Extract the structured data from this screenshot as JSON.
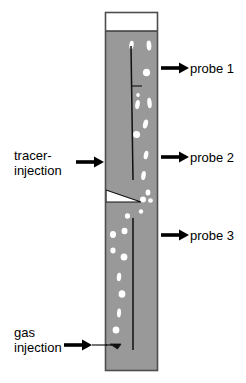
{
  "figure": {
    "type": "bubble-column-schematic",
    "background_color": "#ffffff",
    "column": {
      "body_color": "#999999",
      "border_color": "#4d4d4d",
      "freeboard_color": "#ffffff",
      "left_px": 105,
      "right_px": 158,
      "top_px": 12,
      "bottom_px": 371,
      "freeboard_bottom_px": 31
    },
    "bubble_color": "#ffffff",
    "line_color": "#000000"
  },
  "labels": {
    "probe1": "probe 1",
    "probe2": "probe 2",
    "probe3": "probe 3",
    "tracer_line1": "tracer-",
    "tracer_line2": "injection",
    "gas_line1": "gas",
    "gas_line2": "injection"
  },
  "annotations": [
    {
      "name": "probe-1",
      "text": "probe 1",
      "side": "right",
      "y": 68
    },
    {
      "name": "probe-2",
      "text": "probe 2",
      "side": "right",
      "y": 157
    },
    {
      "name": "probe-3",
      "text": "probe 3",
      "side": "right",
      "y": 235
    },
    {
      "name": "tracer-injection",
      "text": "tracer-injection",
      "side": "left",
      "y": 162
    },
    {
      "name": "gas-injection",
      "text": "gas injection",
      "side": "left",
      "y": 345
    }
  ],
  "bubbles": [
    {
      "cx": 131.5,
      "cy": 45.0,
      "rx": 2.2,
      "ry": 4.2,
      "rot": 8
    },
    {
      "cx": 149.0,
      "cy": 45.5,
      "rx": 2.4,
      "ry": 5.0,
      "rot": -4
    },
    {
      "cx": 146.5,
      "cy": 72.5,
      "rx": 3.6,
      "ry": 3.8,
      "rot": 0
    },
    {
      "cx": 138.0,
      "cy": 95.0,
      "rx": 1.8,
      "ry": 2.0,
      "rot": 0
    },
    {
      "cx": 137.5,
      "cy": 104.5,
      "rx": 2.2,
      "ry": 4.6,
      "rot": 10
    },
    {
      "cx": 149.5,
      "cy": 103.0,
      "rx": 2.2,
      "ry": 5.2,
      "rot": -6
    },
    {
      "cx": 145.5,
      "cy": 124.0,
      "rx": 2.4,
      "ry": 4.6,
      "rot": 14
    },
    {
      "cx": 136.5,
      "cy": 134.5,
      "rx": 3.6,
      "ry": 3.6,
      "rot": 0
    },
    {
      "cx": 146.0,
      "cy": 155.0,
      "rx": 2.2,
      "ry": 4.4,
      "rot": 12
    },
    {
      "cx": 143.5,
      "cy": 175.5,
      "rx": 2.2,
      "ry": 4.6,
      "rot": 10
    },
    {
      "cx": 148.0,
      "cy": 192.5,
      "rx": 2.4,
      "ry": 3.0,
      "rot": 0
    },
    {
      "cx": 143.0,
      "cy": 199.5,
      "rx": 3.0,
      "ry": 3.0,
      "rot": 0
    },
    {
      "cx": 150.5,
      "cy": 200.5,
      "rx": 2.4,
      "ry": 2.2,
      "rot": 0
    },
    {
      "cx": 141.0,
      "cy": 211.5,
      "rx": 2.2,
      "ry": 2.2,
      "rot": 0
    },
    {
      "cx": 127.5,
      "cy": 216.0,
      "rx": 2.6,
      "ry": 2.8,
      "rot": 0
    },
    {
      "cx": 124.5,
      "cy": 231.0,
      "rx": 3.0,
      "ry": 3.2,
      "rot": 0
    },
    {
      "cx": 113.0,
      "cy": 234.5,
      "rx": 3.0,
      "ry": 3.4,
      "rot": 0
    },
    {
      "cx": 113.0,
      "cy": 250.5,
      "rx": 2.6,
      "ry": 3.0,
      "rot": 0
    },
    {
      "cx": 124.0,
      "cy": 257.0,
      "rx": 3.4,
      "ry": 3.6,
      "rot": 0
    },
    {
      "cx": 119.0,
      "cy": 277.0,
      "rx": 2.2,
      "ry": 4.2,
      "rot": 6
    },
    {
      "cx": 122.0,
      "cy": 294.0,
      "rx": 3.4,
      "ry": 3.8,
      "rot": 0
    },
    {
      "cx": 119.0,
      "cy": 313.0,
      "rx": 2.0,
      "ry": 4.4,
      "rot": 4
    },
    {
      "cx": 116.0,
      "cy": 330.0,
      "rx": 3.4,
      "ry": 3.6,
      "rot": 0
    }
  ],
  "internal_lines": {
    "upper_probe_line": {
      "x1": 131,
      "y1": 46,
      "x2": 133,
      "y2": 180
    },
    "lower_probe_line": {
      "x1": 133,
      "y1": 218,
      "x2": 133,
      "y2": 350
    },
    "tracer_tick": {
      "x1": 131,
      "y1": 86,
      "x2": 142,
      "y2": 86
    }
  },
  "wedge": {
    "name": "distributor-wedge",
    "points": "106,190 106,202 141,202",
    "fill": "#ffffff"
  }
}
